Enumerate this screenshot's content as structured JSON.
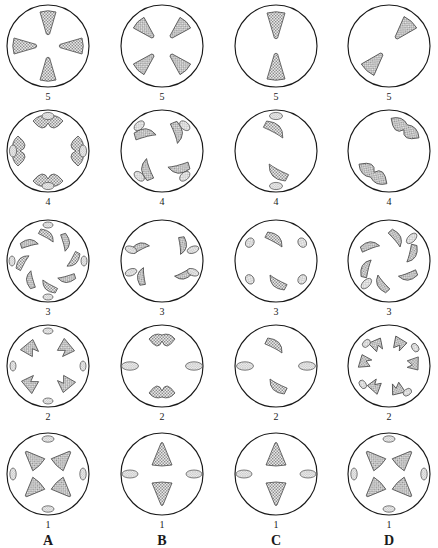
{
  "plate": {
    "title": "",
    "columns": [
      {
        "id": "A",
        "label": "A"
      },
      {
        "id": "B",
        "label": "B"
      },
      {
        "id": "C",
        "label": "C"
      },
      {
        "id": "D",
        "label": "D"
      }
    ],
    "rows": [
      {
        "id": "r5",
        "label": "5"
      },
      {
        "id": "r4",
        "label": "4"
      },
      {
        "id": "r3",
        "label": "3"
      },
      {
        "id": "r2",
        "label": "2"
      },
      {
        "id": "r1",
        "label": "1"
      }
    ],
    "style": {
      "outline_color": "#1a1a1a",
      "fill_color": "#cfcfcf",
      "stipple_color": "#8a8a8a",
      "shape_outline_color": "#4a4a4a",
      "background": "#ffffff"
    },
    "panels": {
      "A5": {
        "stage": "5",
        "column": "A",
        "count": 4,
        "form": "cone-cross"
      },
      "B5": {
        "stage": "5",
        "column": "B",
        "count": 4,
        "form": "cone-diagonal"
      },
      "C5": {
        "stage": "5",
        "column": "C",
        "count": 2,
        "form": "cone-vertical"
      },
      "D5": {
        "stage": "5",
        "column": "D",
        "count": 2,
        "form": "cone-oblique"
      },
      "A4": {
        "stage": "4",
        "column": "A",
        "count": 4,
        "form": "crescent-cross"
      },
      "B4": {
        "stage": "4",
        "column": "B",
        "count": 4,
        "form": "crescent-diagonal"
      },
      "C4": {
        "stage": "4",
        "column": "C",
        "count": 2,
        "form": "crescent-vertical"
      },
      "D4": {
        "stage": "4",
        "column": "D",
        "count": 2,
        "form": "crescent-oblique"
      },
      "A3": {
        "stage": "3",
        "column": "A",
        "count": 8,
        "form": "hook-ring"
      },
      "B3": {
        "stage": "3",
        "column": "B",
        "count": 8,
        "form": "hook-paired"
      },
      "C3": {
        "stage": "3",
        "column": "C",
        "count": 6,
        "form": "hook-scattered"
      },
      "D3": {
        "stage": "3",
        "column": "D",
        "count": 8,
        "form": "hook-swirl"
      },
      "A2": {
        "stage": "2",
        "column": "A",
        "count": 8,
        "form": "arrow-ring"
      },
      "B2": {
        "stage": "2",
        "column": "B",
        "count": 6,
        "form": "arrow-paired"
      },
      "C2": {
        "stage": "2",
        "column": "C",
        "count": 4,
        "form": "arrow-scattered"
      },
      "D2": {
        "stage": "2",
        "column": "D",
        "count": 8,
        "form": "arrow-swirl"
      },
      "A1": {
        "stage": "1",
        "column": "A",
        "count": 8,
        "form": "triangle-ring"
      },
      "B1": {
        "stage": "1",
        "column": "B",
        "count": 4,
        "form": "triangle-cross"
      },
      "C1": {
        "stage": "1",
        "column": "C",
        "count": 4,
        "form": "triangle-cross"
      },
      "D1": {
        "stage": "1",
        "column": "D",
        "count": 8,
        "form": "triangle-ring"
      }
    }
  }
}
